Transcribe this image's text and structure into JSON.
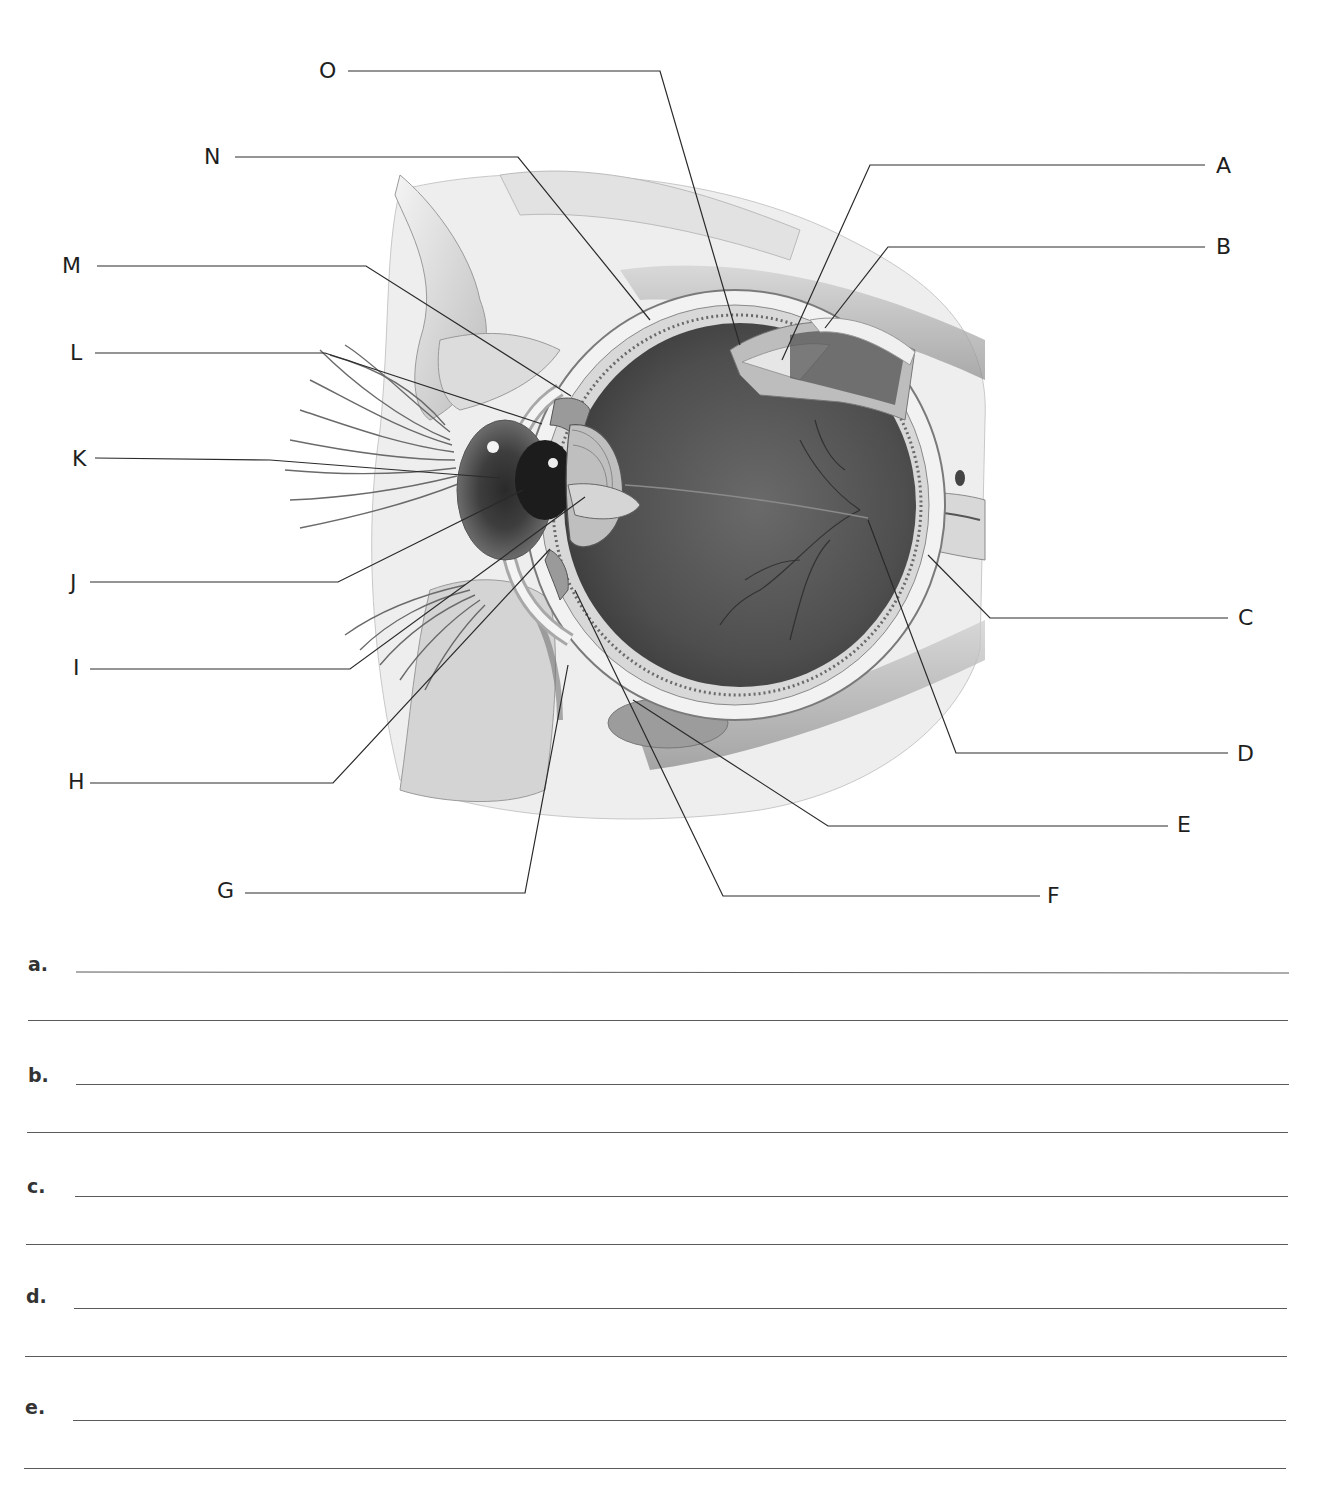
{
  "diagram": {
    "labels": [
      {
        "id": "A",
        "text": "A",
        "x": 1216,
        "y": 155,
        "anchor": "right"
      },
      {
        "id": "B",
        "text": "B",
        "x": 1216,
        "y": 236,
        "anchor": "right"
      },
      {
        "id": "C",
        "text": "C",
        "x": 1238,
        "y": 607,
        "anchor": "right"
      },
      {
        "id": "D",
        "text": "D",
        "x": 1237,
        "y": 743,
        "anchor": "right"
      },
      {
        "id": "E",
        "text": "E",
        "x": 1177,
        "y": 814,
        "anchor": "right"
      },
      {
        "id": "F",
        "text": "F",
        "x": 1047,
        "y": 885,
        "anchor": "right"
      },
      {
        "id": "G",
        "text": "G",
        "x": 217,
        "y": 878,
        "anchor": "left"
      },
      {
        "id": "H",
        "text": "H",
        "x": 68,
        "y": 771,
        "anchor": "left"
      },
      {
        "id": "I",
        "text": "I",
        "x": 73,
        "y": 657,
        "anchor": "left"
      },
      {
        "id": "J",
        "text": "J",
        "x": 70,
        "y": 572,
        "anchor": "left"
      },
      {
        "id": "K",
        "text": "K",
        "x": 72,
        "y": 449,
        "anchor": "left"
      },
      {
        "id": "L",
        "text": "L",
        "x": 70,
        "y": 341,
        "anchor": "left"
      },
      {
        "id": "M",
        "text": "M",
        "x": 62,
        "y": 255,
        "anchor": "left"
      },
      {
        "id": "N",
        "text": "N",
        "x": 204,
        "y": 146,
        "anchor": "left"
      },
      {
        "id": "O",
        "text": "O",
        "x": 319,
        "y": 60,
        "anchor": "left"
      }
    ]
  },
  "answers": {
    "items": [
      {
        "letter": "a.",
        "value": ""
      },
      {
        "letter": "b.",
        "value": ""
      },
      {
        "letter": "c.",
        "value": ""
      },
      {
        "letter": "d.",
        "value": ""
      },
      {
        "letter": "e.",
        "value": ""
      }
    ]
  },
  "colors": {
    "ink": "#1e1e1e",
    "rule": "#5a5a5a",
    "vitreous": "#4a4a4a",
    "tissue": "#e6e6e6"
  }
}
